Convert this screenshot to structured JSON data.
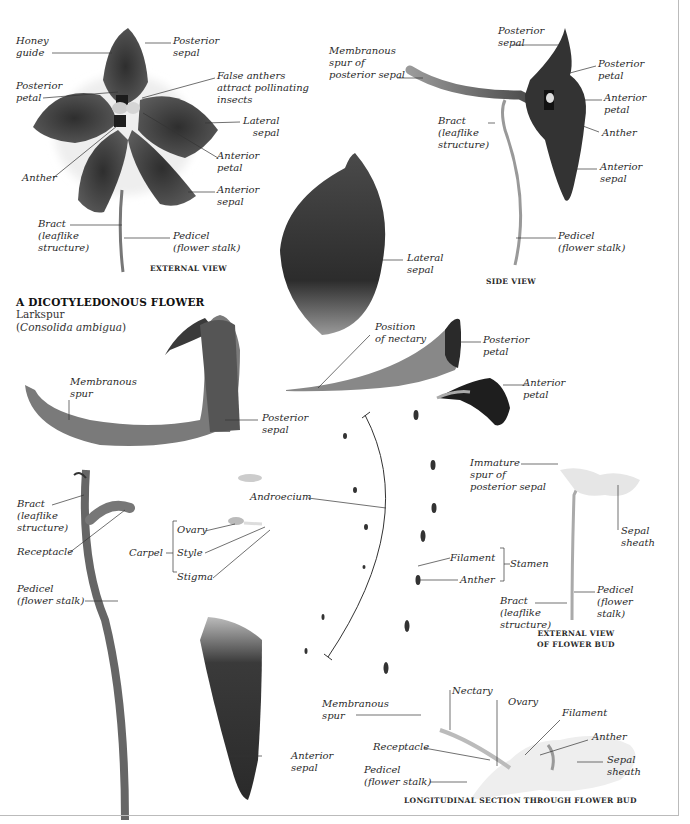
{
  "title": {
    "heading": "A DICOTYLEDONOUS FLOWER",
    "common_name": "Larkspur",
    "scientific_name_open": "(",
    "scientific_name": "Consolida ambigua",
    "scientific_name_close": ")"
  },
  "external_view": {
    "caption": "EXTERNAL VIEW",
    "labels": {
      "honey_guide": "Honey\nguide",
      "posterior_sepal": "Posterior\nsepal",
      "posterior_petal": "Posterior\npetal",
      "false_anthers": "False anthers\nattract pollinating\ninsects",
      "lateral_sepal": "Lateral\nsepal",
      "anterior_petal": "Anterior\npetal",
      "anther": "Anther",
      "anterior_sepal": "Anterior\nsepal",
      "bract": "Bract\n(leaflike\nstructure)",
      "pedicel": "Pedicel\n(flower stalk)"
    }
  },
  "side_view": {
    "caption": "SIDE VIEW",
    "labels": {
      "posterior_sepal": "Posterior\nsepal",
      "membranous_spur": "Membranous\nspur of\nposterior sepal",
      "posterior_petal": "Posterior\npetal",
      "anterior_petal": "Anterior\npetal",
      "bract": "Bract\n(leaflike\nstructure)",
      "anther": "Anther",
      "anterior_sepal": "Anterior\nsepal",
      "pedicel": "Pedicel\n(flower stalk)"
    }
  },
  "dissection": {
    "lateral_sepal": "Lateral\nsepal",
    "position_of_nectary": "Position\nof nectary",
    "posterior_petal": "Posterior\npetal",
    "anterior_petal": "Anterior\npetal",
    "membranous_spur": "Membranous\nspur",
    "posterior_sepal": "Posterior\nsepal",
    "androecium": "Androecium",
    "bract": "Bract\n(leaflike\nstructure)",
    "receptacle": "Receptacle",
    "carpel": "Carpel",
    "ovary": "Ovary",
    "style": "Style",
    "stigma": "Stigma",
    "pedicel": "Pedicel\n(flower stalk)",
    "filament": "Filament",
    "anther": "Anther",
    "stamen": "Stamen",
    "anterior_sepal": "Anterior\nsepal"
  },
  "bud_view": {
    "caption": "EXTERNAL VIEW\nOF FLOWER BUD",
    "labels": {
      "immature_spur": "Immature\nspur of\nposterior sepal",
      "sepal_sheath": "Sepal\nsheath",
      "pedicel": "Pedicel\n(flower\nstalk)",
      "bract": "Bract\n(leaflike\nstructure)"
    }
  },
  "section_view": {
    "caption": "LONGITUDINAL SECTION THROUGH FLOWER BUD",
    "labels": {
      "nectary": "Nectary",
      "membranous_spur": "Membranous\nspur",
      "ovary": "Ovary",
      "filament": "Filament",
      "anther": "Anther",
      "receptacle": "Receptacle",
      "sepal_sheath": "Sepal\nsheath",
      "pedicel": "Pedicel\n(flower stalk)"
    }
  },
  "colors": {
    "petal_dark": "#3a3a3a",
    "petal_mid": "#5a5a5a",
    "leader_line": "#333333",
    "frame": "#bbbbbb"
  }
}
